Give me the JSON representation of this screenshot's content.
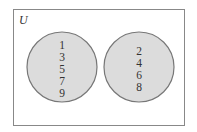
{
  "diagram": {
    "type": "venn",
    "universe_label": "U",
    "sets": [
      {
        "name": "left-set",
        "elements": [
          "1",
          "3",
          "5",
          "7",
          "9"
        ]
      },
      {
        "name": "right-set",
        "elements": [
          "2",
          "4",
          "6",
          "8"
        ]
      }
    ],
    "colors": {
      "circle_fill": "#dcdcdc",
      "circle_stroke": "#777777",
      "frame_stroke": "#888888",
      "text": "#333333"
    }
  }
}
